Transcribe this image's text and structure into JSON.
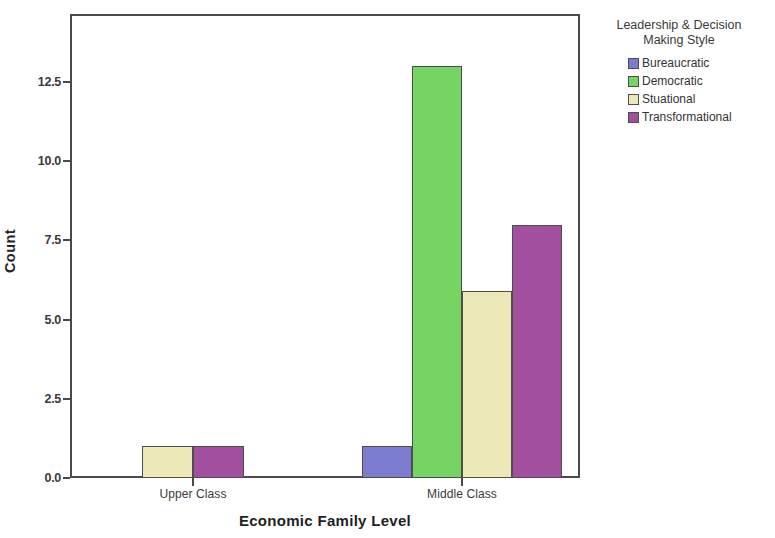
{
  "chart_data": {
    "type": "bar",
    "title": "",
    "subtitle": "",
    "xlabel": "Economic Family Level",
    "ylabel": "Count",
    "categories": [
      "Upper Class",
      "Middle Class"
    ],
    "series": [
      {
        "name": "Bureaucratic",
        "color": "#7b7cd0",
        "values": [
          0,
          1
        ]
      },
      {
        "name": "Democratic",
        "color": "#76d463",
        "values": [
          0,
          13
        ]
      },
      {
        "name": "Stuational",
        "color": "#ece8b8",
        "values": [
          1,
          5.9
        ]
      },
      {
        "name": "Transformational",
        "color": "#a34fa0",
        "values": [
          1,
          8
        ]
      }
    ],
    "ylim": [
      0,
      14.5
    ],
    "yticks": [
      "0.0",
      "2.5",
      "5.0",
      "7.5",
      "10.0",
      "12.5"
    ],
    "ytick_values": [
      0,
      2.5,
      5,
      7.5,
      10,
      12.5
    ],
    "grid": false,
    "legend_position": "right",
    "legend_title": "Leadership & Decision Making Style"
  },
  "axes": {
    "y_title": "Count",
    "x_title": "Economic Family Level"
  },
  "legend": {
    "title_line1": "Leadership & Decision",
    "title_line2": "Making Style",
    "items": [
      {
        "label": "Bureaucratic",
        "color": "#7b7cd0"
      },
      {
        "label": "Democratic",
        "color": "#76d463"
      },
      {
        "label": "Stuational",
        "color": "#ece8b8"
      },
      {
        "label": "Transformational",
        "color": "#a34fa0"
      }
    ]
  }
}
